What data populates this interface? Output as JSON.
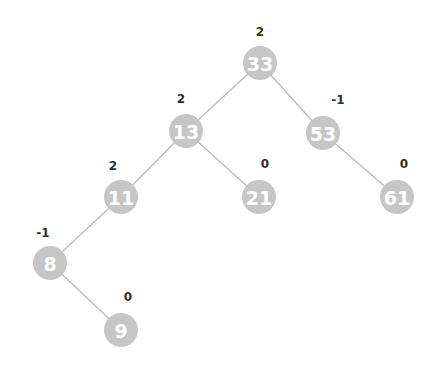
{
  "diagram": {
    "type": "avl-tree",
    "colors": {
      "node": "#c6c6c6",
      "node_text": "#ffffff",
      "edge": "#b9b9b9",
      "balance_text": "#2f2f2f"
    },
    "nodes": [
      {
        "id": "n33",
        "value": "33",
        "balance": "2",
        "x": 260,
        "y": 63,
        "bx": 260,
        "by": 36
      },
      {
        "id": "n13",
        "value": "13",
        "balance": "2",
        "x": 186,
        "y": 131,
        "bx": 181,
        "by": 103
      },
      {
        "id": "n53",
        "value": "53",
        "balance": "-1",
        "x": 323,
        "y": 133,
        "bx": 338,
        "by": 104
      },
      {
        "id": "n11",
        "value": "11",
        "balance": "2",
        "x": 121,
        "y": 197,
        "bx": 113,
        "by": 170
      },
      {
        "id": "n21",
        "value": "21",
        "balance": "0",
        "x": 259,
        "y": 197,
        "bx": 265,
        "by": 168
      },
      {
        "id": "n61",
        "value": "61",
        "balance": "0",
        "x": 397,
        "y": 197,
        "bx": 404,
        "by": 168
      },
      {
        "id": "n8",
        "value": "8",
        "balance": "-1",
        "x": 50,
        "y": 263,
        "bx": 43,
        "by": 237
      },
      {
        "id": "n9",
        "value": "9",
        "balance": "0",
        "x": 121,
        "y": 330,
        "bx": 128,
        "by": 301
      }
    ],
    "edges": [
      {
        "from": "n33",
        "to": "n13"
      },
      {
        "from": "n33",
        "to": "n53"
      },
      {
        "from": "n13",
        "to": "n11"
      },
      {
        "from": "n13",
        "to": "n21"
      },
      {
        "from": "n53",
        "to": "n61"
      },
      {
        "from": "n11",
        "to": "n8"
      },
      {
        "from": "n8",
        "to": "n9"
      }
    ]
  }
}
